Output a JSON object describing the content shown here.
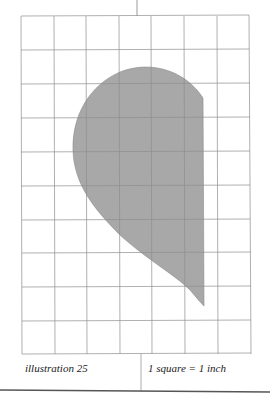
{
  "illustration": {
    "label": "illustration 25",
    "scale": "1 square = 1 inch",
    "grid": {
      "columns": 7,
      "rows": 10,
      "line_color": "#9a9a9a"
    },
    "shape": {
      "fill": "#a8a8a8",
      "stroke": "#7a7a7a",
      "description": "curved teardrop pattern piece"
    }
  }
}
